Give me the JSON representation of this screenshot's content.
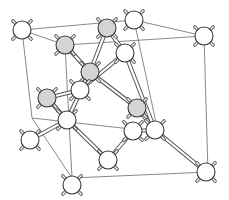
{
  "diagram": {
    "colors": {
      "background": "#ffffff",
      "edge": "#7a7a7a",
      "atom_white": "#ffffff",
      "atom_gray": "#d4d4d4",
      "outline": "#3a3a3a"
    },
    "atom_radius": 9,
    "cube_vertices": {
      "tlb": [
        22,
        30
      ],
      "trb": [
        134,
        20
      ],
      "tlf": [
        65,
        45
      ],
      "trf": [
        204,
        36
      ],
      "blb": [
        32,
        118
      ],
      "brb": [
        158,
        132
      ],
      "blf": [
        72,
        178
      ],
      "brf": [
        208,
        172
      ]
    },
    "cube_edges": [
      [
        "tlb",
        "trb"
      ],
      [
        "tlb",
        "tlf"
      ],
      [
        "trb",
        "trf"
      ],
      [
        "tlf",
        "trf"
      ],
      [
        "tlb",
        "blb"
      ],
      [
        "trb",
        "brb"
      ],
      [
        "tlf",
        "blf"
      ],
      [
        "trf",
        "brf"
      ],
      [
        "blb",
        "brb"
      ],
      [
        "blb",
        "blf"
      ],
      [
        "brb",
        "brf"
      ],
      [
        "blf",
        "brf"
      ]
    ],
    "atoms": [
      {
        "id": "c1",
        "x": 22,
        "y": 30,
        "shade": "white",
        "role": "corner"
      },
      {
        "id": "c2",
        "x": 134,
        "y": 20,
        "shade": "white",
        "role": "corner"
      },
      {
        "id": "f1",
        "x": 65,
        "y": 45,
        "shade": "gray",
        "role": "face"
      },
      {
        "id": "f2",
        "x": 107,
        "y": 28,
        "shade": "gray",
        "role": "face"
      },
      {
        "id": "c3",
        "x": 204,
        "y": 36,
        "shade": "white",
        "role": "corner"
      },
      {
        "id": "i1",
        "x": 90,
        "y": 72,
        "shade": "gray",
        "role": "interior"
      },
      {
        "id": "f3",
        "x": 125,
        "y": 53,
        "shade": "white",
        "role": "face"
      },
      {
        "id": "f4",
        "x": 47,
        "y": 98,
        "shade": "gray",
        "role": "face"
      },
      {
        "id": "i2",
        "x": 80,
        "y": 90,
        "shade": "white",
        "role": "interior"
      },
      {
        "id": "i3",
        "x": 67,
        "y": 120,
        "shade": "white",
        "role": "interior"
      },
      {
        "id": "f5",
        "x": 137,
        "y": 108,
        "shade": "gray",
        "role": "face"
      },
      {
        "id": "f6",
        "x": 133,
        "y": 131,
        "shade": "white",
        "role": "face"
      },
      {
        "id": "i4",
        "x": 155,
        "y": 130,
        "shade": "white",
        "role": "interior"
      },
      {
        "id": "c4",
        "x": 30,
        "y": 140,
        "shade": "white",
        "role": "corner"
      },
      {
        "id": "f7",
        "x": 108,
        "y": 160,
        "shade": "white",
        "role": "face"
      },
      {
        "id": "c5",
        "x": 72,
        "y": 185,
        "shade": "white",
        "role": "corner"
      },
      {
        "id": "c6",
        "x": 206,
        "y": 172,
        "shade": "white",
        "role": "corner"
      }
    ],
    "bonds": [
      [
        "f1",
        "i1"
      ],
      [
        "f2",
        "i1"
      ],
      [
        "f2",
        "f3"
      ],
      [
        "i1",
        "i3"
      ],
      [
        "f4",
        "i3"
      ],
      [
        "i1",
        "f5"
      ],
      [
        "f3",
        "i2"
      ],
      [
        "i1",
        "i2"
      ],
      [
        "i3",
        "c4"
      ],
      [
        "i3",
        "f7"
      ],
      [
        "f5",
        "i4"
      ],
      [
        "f3",
        "i4"
      ],
      [
        "i4",
        "c6"
      ],
      [
        "i4",
        "f6"
      ],
      [
        "f6",
        "f7"
      ],
      [
        "i2",
        "f4"
      ]
    ]
  }
}
